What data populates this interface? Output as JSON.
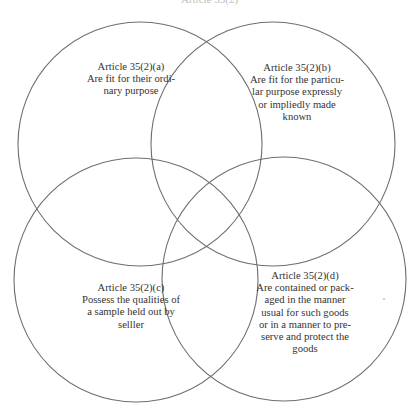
{
  "header": {
    "cut_off_text": "Article 35(2)"
  },
  "diagram": {
    "type": "venn",
    "stroke_color": "#6e6e6e",
    "circles": [
      {
        "id": "a",
        "cx": 140,
        "cy": 144,
        "r": 122,
        "title": "Article 35(2)(a)",
        "lines": [
          "Are fit for their ordi-",
          "nary purpose"
        ]
      },
      {
        "id": "b",
        "cx": 273,
        "cy": 144,
        "r": 122,
        "title": "Article 35(2)(b)",
        "lines": [
          "Are fit for the particu-",
          "lar purpose expressly",
          "or impliedly made",
          "known"
        ]
      },
      {
        "id": "c",
        "cx": 136,
        "cy": 280,
        "r": 122,
        "title": "Article 35(2)(c)",
        "lines": [
          "Possess the qualities of",
          "a sample held out by",
          "selller"
        ]
      },
      {
        "id": "d",
        "cx": 284,
        "cy": 279,
        "r": 122,
        "title": "Article 35(2)(d)",
        "lines": [
          "Are contained or pack-",
          "aged in the manner",
          "usual for such goods",
          "or in a manner to pre-",
          "serve and protect the",
          "goods"
        ]
      }
    ]
  }
}
